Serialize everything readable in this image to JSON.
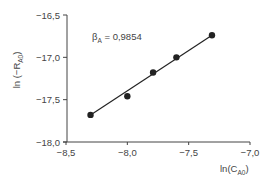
{
  "chart_data": {
    "type": "scatter",
    "title": "",
    "xlabel": "ln(C_A0)",
    "xlabel_main": "ln(C",
    "xlabel_sub": "A0",
    "xlabel_end": ")",
    "ylabel": "ln (-R_A0)",
    "ylabel_main": "ln (−R",
    "ylabel_sub": "A0",
    "ylabel_end": ")",
    "xlim": [
      -8.5,
      -7.0
    ],
    "ylim": [
      -18.0,
      -16.5
    ],
    "x_ticks": [
      -8.5,
      -8.0,
      -7.5,
      -7.0
    ],
    "x_tick_labels": [
      "−8,5",
      "−8,0",
      "−7,5",
      "−7,0"
    ],
    "y_ticks": [
      -16.5,
      -17.0,
      -17.5,
      -18.0
    ],
    "y_tick_labels": [
      "−16,5",
      "−17,0",
      "−17,5",
      "−18,0"
    ],
    "grid": false,
    "legend": null,
    "series": [
      {
        "name": "data",
        "x": [
          -8.3,
          -8.0,
          -7.79,
          -7.6,
          -7.31
        ],
        "y": [
          -17.68,
          -17.46,
          -17.18,
          -17.0,
          -16.74
        ],
        "marker": "filled-circle",
        "color": "#222222",
        "connected_by_fit_line": true
      }
    ],
    "fit_line": {
      "x": [
        -8.3,
        -7.31
      ],
      "y": [
        -17.68,
        -16.74
      ]
    },
    "annotation": {
      "symbol": "β",
      "sub": "A",
      "text": " = 0,9854",
      "value": 0.9854
    }
  }
}
